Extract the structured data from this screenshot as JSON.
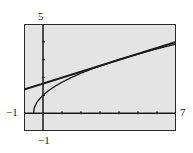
{
  "chart_data": {
    "type": "line",
    "title": "",
    "xlabel": "",
    "ylabel": "",
    "xlim": [
      -1,
      7
    ],
    "ylim": [
      -1,
      5
    ],
    "xscale": 1,
    "yscale": 1,
    "grid": false,
    "window_labels": {
      "xmin": "−1",
      "xmax": "7",
      "ymin": "−1",
      "ymax": "5"
    },
    "series": [
      {
        "name": "curve",
        "expression": "y = sqrt(2x + 1)",
        "x": [
          -0.5,
          0,
          1,
          2,
          3,
          4,
          5,
          6,
          7
        ],
        "y": [
          0,
          1,
          1.73,
          2.24,
          2.65,
          3,
          3.32,
          3.61,
          3.87
        ]
      },
      {
        "name": "tangent line",
        "expression": "y = x/3 + 5/3",
        "x": [
          -1,
          7
        ],
        "y": [
          1.33,
          4
        ]
      }
    ],
    "colors": {
      "background": "#e4e4e4",
      "ink": "#1a1a1a"
    }
  }
}
